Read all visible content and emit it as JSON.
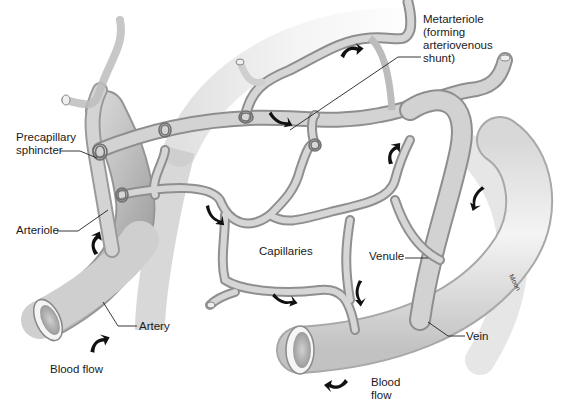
{
  "figure": {
    "colors": {
      "background": "#ffffff",
      "vessel_fill": "#c9c9c9",
      "vessel_highlight": "#efefef",
      "vessel_shadow": "#8e8e8e",
      "arrow": "#111111",
      "leader_line": "#222222"
    }
  },
  "labels": {
    "metarteriole": "Metarteriole\n(forming\narteriovenous\nshunt)",
    "precapillary_sphincter": "Precapillary\nsphincter",
    "arteriole": "Arteriole",
    "capillaries": "Capillaries",
    "venule": "Venule",
    "artery": "Artery",
    "vein": "Vein",
    "blood_flow_left": "Blood flow",
    "blood_flow_right": "Blood\nflow",
    "artist_signature": "Moon"
  },
  "arrows": [
    {
      "id": "flow-arrow-metarteriole-top",
      "direction": "right"
    },
    {
      "id": "flow-arrow-metarteriole-mid",
      "direction": "right"
    },
    {
      "id": "flow-arrow-arteriole",
      "direction": "up"
    },
    {
      "id": "flow-arrow-capillary-left",
      "direction": "down-right"
    },
    {
      "id": "flow-arrow-capillary-right-up",
      "direction": "up-right"
    },
    {
      "id": "flow-arrow-venule-down",
      "direction": "down"
    },
    {
      "id": "flow-arrow-capillary-bottom",
      "direction": "right"
    },
    {
      "id": "flow-arrow-capillary-down",
      "direction": "down"
    },
    {
      "id": "flow-arrow-artery-in",
      "direction": "up-right"
    },
    {
      "id": "flow-arrow-vein-out",
      "direction": "left"
    }
  ]
}
